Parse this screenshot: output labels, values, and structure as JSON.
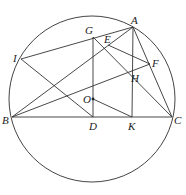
{
  "diagram": {
    "type": "geometry",
    "circle": {
      "cx": 92,
      "cy": 99,
      "r": 83,
      "stroke": "#444444"
    },
    "points": [
      {
        "id": "A",
        "label": "A",
        "x": 133,
        "y": 27,
        "lx": 131,
        "ly": 15
      },
      {
        "id": "G",
        "label": "G",
        "x": 93,
        "y": 37,
        "lx": 85,
        "ly": 25
      },
      {
        "id": "E",
        "label": "E",
        "x": 108,
        "y": 45,
        "lx": 104,
        "ly": 34
      },
      {
        "id": "I",
        "label": "I",
        "x": 21,
        "y": 59,
        "lx": 13,
        "ly": 53
      },
      {
        "id": "F",
        "label": "F",
        "x": 150,
        "y": 64,
        "lx": 152,
        "ly": 58
      },
      {
        "id": "H",
        "label": "H",
        "x": 133,
        "y": 72,
        "lx": 131,
        "ly": 73
      },
      {
        "id": "O",
        "label": "O",
        "x": 93,
        "y": 99,
        "lx": 83,
        "ly": 94
      },
      {
        "id": "B",
        "label": "B",
        "x": 12,
        "y": 117,
        "lx": 2,
        "ly": 115
      },
      {
        "id": "D",
        "label": "D",
        "x": 93,
        "y": 117,
        "lx": 89,
        "ly": 121
      },
      {
        "id": "K",
        "label": "K",
        "x": 132,
        "y": 117,
        "lx": 128,
        "ly": 121
      },
      {
        "id": "C",
        "label": "C",
        "x": 172,
        "y": 117,
        "lx": 174,
        "ly": 115
      }
    ],
    "segments": [
      [
        "B",
        "C"
      ],
      [
        "B",
        "A"
      ],
      [
        "B",
        "F"
      ],
      [
        "I",
        "A"
      ],
      [
        "I",
        "D"
      ],
      [
        "G",
        "D"
      ],
      [
        "G",
        "C"
      ],
      [
        "E",
        "F"
      ],
      [
        "A",
        "K"
      ],
      [
        "A",
        "C"
      ],
      [
        "O",
        "K"
      ]
    ],
    "dots": [
      "O"
    ],
    "stroke_color": "#333333"
  }
}
